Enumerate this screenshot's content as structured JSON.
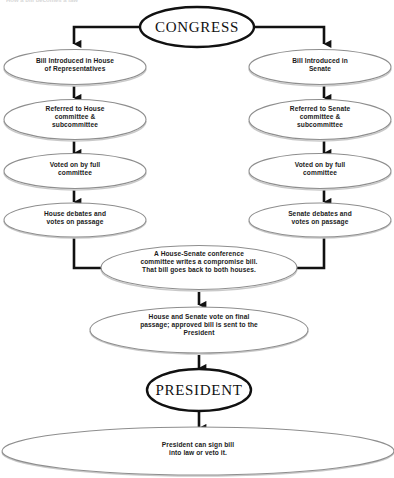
{
  "diagram": {
    "title": "How a Bill Becomes a Law",
    "type": "flowchart",
    "clipped_header_text": "How a bill becomes a law",
    "colors": {
      "primary_stroke": "#111111",
      "node_stroke": "#8a8a8a",
      "node_shadow": "#b4b4b4",
      "text": "#1b1b1b",
      "background": "#ffffff"
    },
    "nodes": {
      "congress": "CONGRESS",
      "house_intro": "Bill Introduced in House\nof Representatives",
      "house_referred": "Referred to House\ncommittee &\nsubcommittee",
      "house_voted": "Voted on by full\ncommittee",
      "house_debates": "House debates and\nvotes on passage",
      "senate_intro": "Bill Introduced in\nSenate",
      "senate_referred": "Referred to Senate\ncommittee &\nsubcommittee",
      "senate_voted": "Voted on by full\ncommittee",
      "senate_debates": "Senate debates and\nvotes on passage",
      "conference": "A House-Senate conference\ncommittee writes a compromise bill.\nThat bill goes back to both houses.",
      "final_vote": "House and Senate vote on final\npassage; approved bill is sent to the\nPresident",
      "president": "PRESIDENT",
      "sign_or_veto": "President can sign bill\ninto law or veto it."
    }
  }
}
